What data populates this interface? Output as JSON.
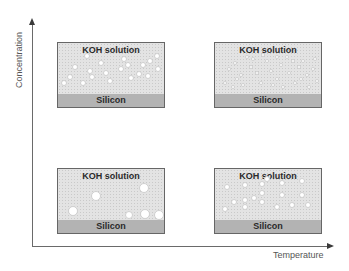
{
  "axes": {
    "y_label": "Concentration",
    "x_label": "Temperature"
  },
  "panels": [
    {
      "id": "low-temp-high-conc",
      "solution_label": "KOH solution",
      "substrate_label": "Silicon",
      "bubble_size": "small",
      "bubbles": [
        [
          17,
          24,
          3
        ],
        [
          29,
          13,
          3
        ],
        [
          32,
          28,
          3
        ],
        [
          43,
          20,
          3
        ],
        [
          48,
          30,
          3
        ],
        [
          52,
          38,
          3
        ],
        [
          63,
          26,
          3
        ],
        [
          66,
          16,
          3
        ],
        [
          70,
          22,
          3
        ],
        [
          73,
          35,
          3
        ],
        [
          81,
          31,
          3
        ],
        [
          85,
          22,
          3
        ],
        [
          92,
          18,
          3
        ],
        [
          99,
          13,
          3
        ],
        [
          100,
          26,
          3
        ],
        [
          12,
          34,
          3
        ],
        [
          34,
          34,
          3
        ],
        [
          25,
          40,
          3
        ],
        [
          90,
          33,
          3
        ],
        [
          6,
          40,
          3
        ]
      ]
    },
    {
      "id": "high-temp-high-conc",
      "solution_label": "KOH solution",
      "substrate_label": "Silicon",
      "bubble_size": "tiny",
      "bubbles": [
        [
          14,
          26,
          2
        ],
        [
          20,
          20,
          2
        ],
        [
          26,
          32,
          2
        ],
        [
          32,
          14,
          2
        ],
        [
          36,
          24,
          2
        ],
        [
          42,
          30,
          2
        ],
        [
          46,
          40,
          2
        ],
        [
          52,
          18,
          2
        ],
        [
          56,
          28,
          2
        ],
        [
          62,
          36,
          2
        ],
        [
          66,
          22,
          2
        ],
        [
          72,
          14,
          2
        ],
        [
          74,
          30,
          2
        ],
        [
          80,
          40,
          2
        ],
        [
          84,
          24,
          2
        ],
        [
          88,
          18,
          2
        ],
        [
          92,
          32,
          2
        ],
        [
          98,
          26,
          2
        ],
        [
          102,
          38,
          2
        ],
        [
          10,
          40,
          2
        ],
        [
          18,
          44,
          2
        ],
        [
          28,
          42,
          2
        ],
        [
          38,
          16,
          2
        ],
        [
          58,
          42,
          2
        ],
        [
          68,
          44,
          2
        ],
        [
          78,
          18,
          2
        ],
        [
          94,
          44,
          2
        ],
        [
          100,
          16,
          2
        ],
        [
          48,
          12,
          2
        ],
        [
          86,
          36,
          2
        ],
        [
          22,
          36,
          2
        ],
        [
          62,
          14,
          2
        ]
      ]
    },
    {
      "id": "low-temp-low-conc",
      "solution_label": "KOH solution",
      "substrate_label": "Silicon",
      "bubble_size": "large",
      "bubbles": [
        [
          38,
          27,
          5
        ],
        [
          86,
          19,
          5
        ],
        [
          15,
          42,
          5
        ],
        [
          71,
          46,
          4
        ],
        [
          87,
          45,
          5
        ],
        [
          101,
          46,
          5
        ]
      ]
    },
    {
      "id": "high-temp-low-conc",
      "solution_label": "KOH solution",
      "substrate_label": "Silicon",
      "bubble_size": "medium",
      "bubbles": [
        [
          12,
          18,
          3
        ],
        [
          30,
          16,
          3
        ],
        [
          47,
          15,
          3
        ],
        [
          67,
          14,
          3
        ],
        [
          87,
          12,
          3
        ],
        [
          47,
          24,
          3
        ],
        [
          19,
          33,
          3
        ],
        [
          30,
          31,
          3
        ],
        [
          39,
          29,
          3
        ],
        [
          67,
          26,
          3
        ],
        [
          87,
          26,
          3
        ],
        [
          47,
          33,
          3
        ],
        [
          10,
          40,
          3
        ],
        [
          30,
          38,
          3
        ],
        [
          62,
          38,
          3
        ],
        [
          77,
          36,
          3
        ],
        [
          93,
          36,
          3
        ],
        [
          52,
          10,
          3
        ]
      ]
    }
  ]
}
